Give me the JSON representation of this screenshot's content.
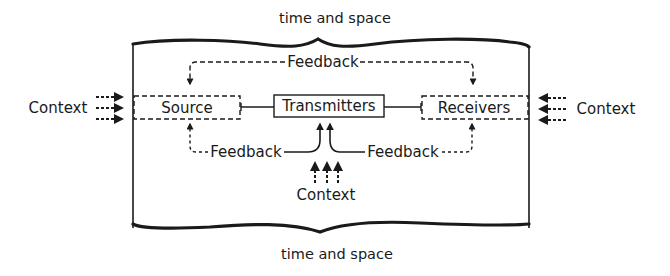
{
  "diagram": {
    "type": "communication-model",
    "top_label": "time and space",
    "bottom_label": "time and space",
    "nodes": {
      "source": "Source",
      "transmitters": "Transmitters",
      "receivers": "Receivers"
    },
    "feedback": {
      "top": "Feedback",
      "bottom_left": "Feedback",
      "bottom_right": "Feedback"
    },
    "context": {
      "left": "Context",
      "right": "Context",
      "bottom": "Context"
    },
    "colors": {
      "ink": "#1a1a1a",
      "background": "#ffffff"
    }
  }
}
